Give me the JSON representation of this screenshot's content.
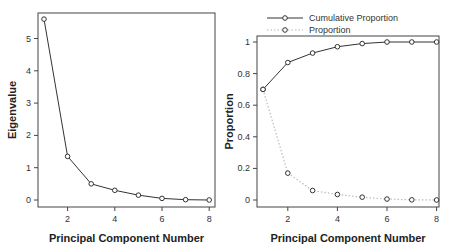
{
  "chart_data": [
    {
      "type": "line",
      "title": "",
      "xlabel": "Principal Component Number",
      "ylabel": "Eigenvalue",
      "x": [
        1,
        2,
        3,
        4,
        5,
        6,
        7,
        8
      ],
      "series": [
        {
          "name": "Eigenvalue",
          "values": [
            5.6,
            1.35,
            0.5,
            0.3,
            0.15,
            0.05,
            0.01,
            0.0
          ],
          "color": "#333333",
          "style": "solid"
        }
      ],
      "xticks": [
        2,
        4,
        6,
        8
      ],
      "yticks": [
        0,
        1,
        2,
        3,
        4,
        5
      ],
      "xlim": [
        0.8,
        8.2
      ],
      "ylim": [
        -0.2,
        5.8
      ],
      "grid": false,
      "legend": null
    },
    {
      "type": "line",
      "title": "",
      "xlabel": "Principal Component Number",
      "ylabel": "Proportion",
      "x": [
        1,
        2,
        3,
        4,
        5,
        6,
        7,
        8
      ],
      "series": [
        {
          "name": "Cumulative Proportion",
          "values": [
            0.7,
            0.87,
            0.93,
            0.97,
            0.99,
            1.0,
            1.0,
            1.0
          ],
          "color": "#333333",
          "style": "solid"
        },
        {
          "name": "Proportion",
          "values": [
            0.7,
            0.17,
            0.06,
            0.035,
            0.018,
            0.006,
            0.001,
            0.0
          ],
          "color": "#bbbbbb",
          "style": "dotted"
        }
      ],
      "xticks": [
        2,
        4,
        6,
        8
      ],
      "yticks": [
        0,
        0.2,
        0.4,
        0.6,
        0.8,
        1
      ],
      "ytick_labels": [
        "0",
        "0.2",
        "0.4",
        "0.6",
        "0.8",
        "1"
      ],
      "xlim": [
        0.8,
        8.2
      ],
      "ylim": [
        -0.04,
        1.04
      ],
      "grid": false,
      "legend": {
        "position": "top",
        "entries": [
          "Cumulative Proportion",
          "Proportion"
        ]
      }
    }
  ]
}
